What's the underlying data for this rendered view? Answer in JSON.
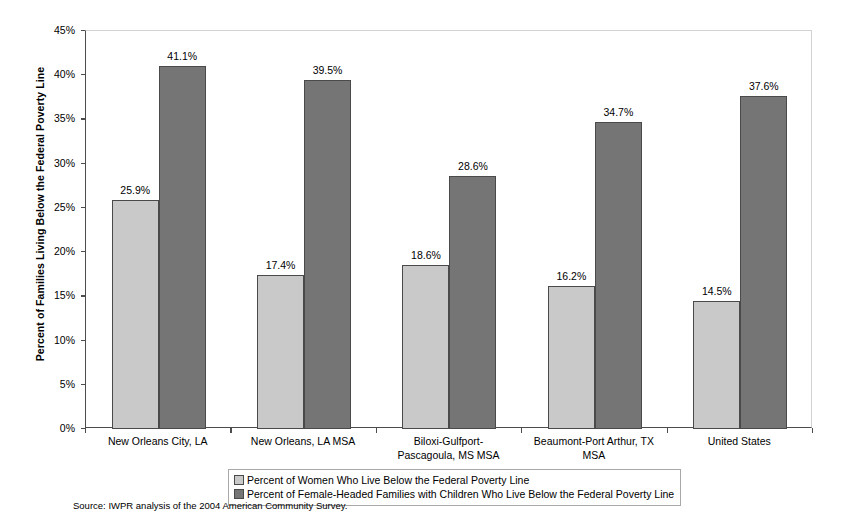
{
  "chart_data": {
    "type": "bar",
    "title": "",
    "subtitle": "",
    "xlabel": "",
    "ylabel": "Percent of Families Living Below the Federal Poverty Line",
    "ylim": [
      0,
      45
    ],
    "ytick_labels": [
      "0%",
      "5%",
      "10%",
      "15%",
      "20%",
      "25%",
      "30%",
      "35%",
      "40%",
      "45%"
    ],
    "ytick_values": [
      0,
      5,
      10,
      15,
      20,
      25,
      30,
      35,
      40,
      45
    ],
    "grid": false,
    "legend_position": "bottom",
    "categories": [
      "New Orleans City, LA",
      "New Orleans, LA MSA",
      "Biloxi-Gulfport-Pascagoula, MS MSA",
      "Beaumont-Port Arthur, TX MSA",
      "United States"
    ],
    "category_lines": [
      [
        "New Orleans City, LA"
      ],
      [
        "New Orleans, LA MSA"
      ],
      [
        "Biloxi-Gulfport-",
        "Pascagoula, MS MSA"
      ],
      [
        "Beaumont-Port Arthur, TX",
        "MSA"
      ],
      [
        "United States"
      ]
    ],
    "series": [
      {
        "name": "Percent of Women Who Live Below the Federal Poverty Line",
        "color": "#c9c9c9",
        "values": [
          25.9,
          17.4,
          18.6,
          16.2,
          14.5
        ],
        "labels": [
          "25.9%",
          "17.4%",
          "18.6%",
          "16.2%",
          "14.5%"
        ]
      },
      {
        "name": "Percent of Female-Headed Families with Children Who Live Below the Federal Poverty Line",
        "color": "#757575",
        "values": [
          41.1,
          39.5,
          28.6,
          34.7,
          37.6
        ],
        "labels": [
          "41.1%",
          "39.5%",
          "28.6%",
          "34.7%",
          "37.6%"
        ]
      }
    ],
    "annotations": [
      "Source: IWPR analysis of the 2004 American Community Survey."
    ]
  },
  "legend": {
    "items": [
      {
        "label": "Percent of Women Who Live Below the Federal Poverty Line",
        "swatch": "light"
      },
      {
        "label": "Percent of Female-Headed Families with Children Who Live Below the Federal Poverty Line",
        "swatch": "dark"
      }
    ]
  },
  "source": {
    "text": "Source: IWPR analysis of the 2004 American Community Survey."
  }
}
